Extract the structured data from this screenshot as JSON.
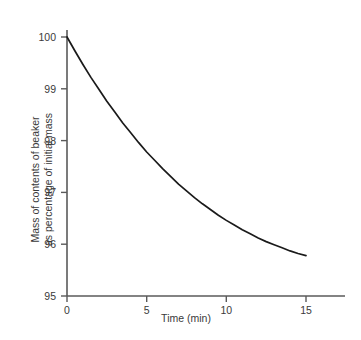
{
  "chart_data": {
    "type": "line",
    "title": "",
    "xlabel": "Time (min)",
    "ylabel_line1": "Mass of contents of beaker",
    "ylabel_line2": "as percentage of initial mass",
    "ylabel": "Mass of contents of beaker as percentage of initial mass",
    "xlim": [
      0,
      15
    ],
    "ylim": [
      95,
      100
    ],
    "xticks": [
      0,
      5,
      10,
      15
    ],
    "xtick_labels": [
      "0",
      "5",
      "10",
      "15"
    ],
    "yticks": [
      95,
      96,
      97,
      98,
      99,
      100
    ],
    "ytick_labels": [
      "95",
      "96",
      "97",
      "98",
      "99",
      "100"
    ],
    "grid": false,
    "legend": "none",
    "line_color": "#1a1a1a",
    "axis_color": "#5a5a5a",
    "series": [
      {
        "name": "mass percentage",
        "x": [
          0,
          0.5,
          1,
          1.5,
          2,
          2.5,
          3,
          3.5,
          4,
          4.5,
          5,
          5.5,
          6,
          6.5,
          7,
          7.5,
          8,
          8.5,
          9,
          9.5,
          10,
          10.5,
          11,
          11.5,
          12,
          12.5,
          13,
          13.5,
          14,
          14.5,
          15
        ],
        "values": [
          100.0,
          99.73,
          99.47,
          99.22,
          98.99,
          98.76,
          98.55,
          98.34,
          98.15,
          97.96,
          97.78,
          97.62,
          97.46,
          97.31,
          97.16,
          97.03,
          96.9,
          96.78,
          96.67,
          96.56,
          96.46,
          96.37,
          96.28,
          96.2,
          96.12,
          96.05,
          95.99,
          95.93,
          95.87,
          95.82,
          95.78
        ]
      }
    ]
  },
  "axis_geometry": {
    "x0_px": 67,
    "x15_px": 306,
    "x_axis_end_px": 345,
    "y100_px": 37,
    "y95_px": 296,
    "y_axis_top_px": 30
  }
}
